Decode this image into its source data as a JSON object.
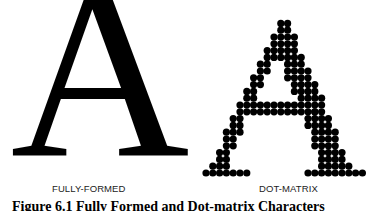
{
  "figure": {
    "left_glyph": "A",
    "left_label": "FULLY-FORMED",
    "right_label": "DOT-MATRIX",
    "caption": "Figure 6.1  Fully Formed and Dot-matrix Characters"
  },
  "dot_matrix": {
    "glyph": "A",
    "dot_color": "#000000",
    "pitch_px": 6.8,
    "rows": [
      [
        [
          11,
          12
        ]
      ],
      [
        [
          11,
          12
        ]
      ],
      [
        [
          10,
          13
        ]
      ],
      [
        [
          10,
          13
        ]
      ],
      [
        [
          9,
          13
        ]
      ],
      [
        [
          9,
          10
        ],
        [
          11,
          14
        ]
      ],
      [
        [
          8,
          9
        ],
        [
          12,
          14
        ]
      ],
      [
        [
          8,
          9
        ],
        [
          12,
          15
        ]
      ],
      [
        [
          7,
          8
        ],
        [
          12,
          15
        ]
      ],
      [
        [
          7,
          8
        ],
        [
          13,
          16
        ]
      ],
      [
        [
          6,
          7
        ],
        [
          13,
          16
        ]
      ],
      [
        [
          6,
          7
        ],
        [
          14,
          17
        ]
      ],
      [
        [
          5,
          17
        ]
      ],
      [
        [
          5,
          16
        ],
        [
          16,
          17
        ]
      ],
      [
        [
          4,
          5
        ],
        [
          15,
          18
        ]
      ],
      [
        [
          4,
          5
        ],
        [
          15,
          18
        ]
      ],
      [
        [
          3,
          5
        ],
        [
          16,
          19
        ]
      ],
      [
        [
          3,
          4
        ],
        [
          16,
          19
        ]
      ],
      [
        [
          3,
          4
        ],
        [
          16,
          19
        ]
      ],
      [
        [
          2,
          3
        ],
        [
          17,
          20
        ]
      ],
      [
        [
          2,
          3
        ],
        [
          17,
          20
        ]
      ],
      [
        [
          1,
          3
        ],
        [
          17,
          21
        ]
      ],
      [
        [
          0,
          6
        ],
        [
          15,
          23
        ]
      ]
    ]
  }
}
